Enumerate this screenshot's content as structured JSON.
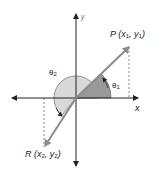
{
  "diagram": {
    "title": "",
    "axes": {
      "x_label": "x",
      "y_label": "y"
    },
    "points": [
      {
        "name": "P",
        "label_prefix": "P (",
        "var1": "x",
        "sub1": "1",
        "sep": ", ",
        "var2": "y",
        "sub2": "1",
        "suffix": ")"
      },
      {
        "name": "R",
        "label_prefix": "R (",
        "var1": "x",
        "sub1": "2",
        "sep": ", ",
        "var2": "y",
        "sub2": "2",
        "suffix": ")"
      }
    ],
    "angles": [
      {
        "name": "theta1",
        "symbol": "θ",
        "sub": "1",
        "shade": "#9a9a9a"
      },
      {
        "name": "theta2",
        "symbol": "θ",
        "sub": "2",
        "shade": "#d9d9d9"
      }
    ],
    "colors": {
      "axis": "#222222",
      "vector": "#8c8c8c",
      "dashed": "#666666"
    }
  }
}
